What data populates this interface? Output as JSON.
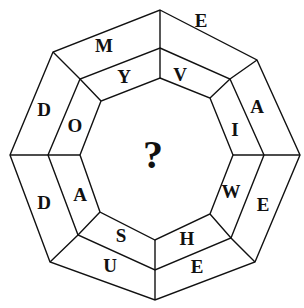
{
  "puzzle": {
    "center": "?",
    "outer_ring": [
      "E",
      "A",
      "E",
      "E",
      "U",
      "D",
      "D",
      "M"
    ],
    "inner_ring": [
      "V",
      "I",
      "W",
      "H",
      "S",
      "A",
      "O",
      "Y"
    ],
    "segments": [
      {
        "position": "top-right",
        "outer": "E",
        "inner": "V"
      },
      {
        "position": "right-upper",
        "outer": "A",
        "inner": "I"
      },
      {
        "position": "right-lower",
        "outer": "E",
        "inner": "W"
      },
      {
        "position": "bottom-right",
        "outer": "E",
        "inner": "H"
      },
      {
        "position": "bottom-left",
        "outer": "U",
        "inner": "S"
      },
      {
        "position": "left-lower",
        "outer": "D",
        "inner": "A"
      },
      {
        "position": "left-upper",
        "outer": "D",
        "inner": "O"
      },
      {
        "position": "top-left",
        "outer": "M",
        "inner": "Y"
      }
    ]
  }
}
